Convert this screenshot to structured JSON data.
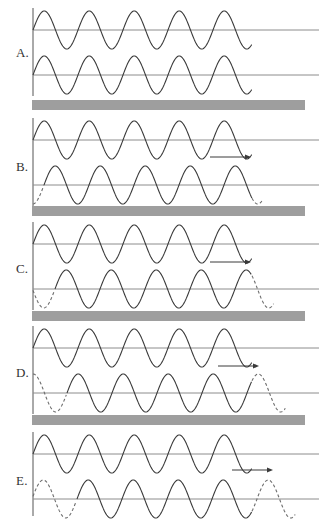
{
  "figure": {
    "type": "wave-phase-shift-diagram",
    "panel_count": 5,
    "width": 319,
    "height": 520,
    "background": "#ffffff"
  },
  "colors": {
    "wave_solid": "#3a3a3a",
    "wave_dashed": "#6d6d6d",
    "baseline": "#8c8c8c",
    "axis": "#555555",
    "separator_bar": "#9e9e9e",
    "label_text": "#333333"
  },
  "geometry": {
    "axis_x": 33,
    "wave_start_x": 33,
    "wave_end_x": 252,
    "baseline_end_x": 319,
    "wavelength": 45,
    "amplitude": 19,
    "separator_left": 32,
    "separator_right": 305,
    "separator_height": 10
  },
  "panels": [
    {
      "id": "A",
      "label": "A.",
      "label_x": 16,
      "label_y": 46,
      "top": 8,
      "axis_y0": 8,
      "axis_y1": 96,
      "arrow": null,
      "waves": [
        {
          "name": "reference-wave",
          "baseline_y": 30,
          "phase_shift_px": 0,
          "dash_lead_px": 0,
          "dash_trail_px": 0
        },
        {
          "name": "shifted-wave",
          "baseline_y": 75,
          "phase_shift_px": 0,
          "dash_lead_px": 0,
          "dash_trail_px": 0
        }
      ]
    },
    {
      "id": "B",
      "label": "B.",
      "label_x": 16,
      "label_y": 160,
      "top": 118,
      "axis_y0": 118,
      "axis_y1": 206,
      "arrow": {
        "name": "shift-direction-arrow",
        "x1": 210,
        "x2": 251,
        "y": 157,
        "direction": "right"
      },
      "waves": [
        {
          "name": "reference-wave",
          "baseline_y": 140,
          "phase_shift_px": 0,
          "dash_lead_px": 0,
          "dash_trail_px": 0
        },
        {
          "name": "shifted-wave",
          "baseline_y": 185,
          "phase_shift_px": 11,
          "dash_lead_px": 11,
          "dash_trail_px": 11
        }
      ]
    },
    {
      "id": "C",
      "label": "C.",
      "label_x": 16,
      "label_y": 262,
      "top": 222,
      "axis_y0": 222,
      "axis_y1": 310,
      "arrow": {
        "name": "shift-direction-arrow",
        "x1": 210,
        "x2": 251,
        "y": 262,
        "direction": "right"
      },
      "waves": [
        {
          "name": "reference-wave",
          "baseline_y": 244,
          "phase_shift_px": 0,
          "dash_lead_px": 0,
          "dash_trail_px": 0
        },
        {
          "name": "shifted-wave",
          "baseline_y": 289,
          "phase_shift_px": 22,
          "dash_lead_px": 22,
          "dash_trail_px": 22
        }
      ]
    },
    {
      "id": "D",
      "label": "D.",
      "label_x": 16,
      "label_y": 366,
      "top": 326,
      "axis_y0": 326,
      "axis_y1": 414,
      "arrow": {
        "name": "shift-direction-arrow",
        "x1": 218,
        "x2": 259,
        "y": 366,
        "direction": "right"
      },
      "waves": [
        {
          "name": "reference-wave",
          "baseline_y": 348,
          "phase_shift_px": 0,
          "dash_lead_px": 0,
          "dash_trail_px": 0
        },
        {
          "name": "shifted-wave",
          "baseline_y": 393,
          "phase_shift_px": 34,
          "dash_lead_px": 34,
          "dash_trail_px": 34
        }
      ]
    },
    {
      "id": "E",
      "label": "E.",
      "label_x": 16,
      "label_y": 474,
      "top": 432,
      "axis_y0": 432,
      "axis_y1": 516,
      "arrow": {
        "name": "shift-direction-arrow",
        "x1": 232,
        "x2": 273,
        "y": 470,
        "direction": "right"
      },
      "waves": [
        {
          "name": "reference-wave",
          "baseline_y": 454,
          "phase_shift_px": 0,
          "dash_lead_px": 0,
          "dash_trail_px": 0
        },
        {
          "name": "shifted-wave",
          "baseline_y": 499,
          "phase_shift_px": 44,
          "dash_lead_px": 44,
          "dash_trail_px": 44
        }
      ]
    }
  ],
  "separators": [
    {
      "name": "separator-bar-1",
      "x": 32,
      "y": 100,
      "width": 273,
      "height": 10
    },
    {
      "name": "separator-bar-2",
      "x": 32,
      "y": 206,
      "width": 273,
      "height": 10
    },
    {
      "name": "separator-bar-3",
      "x": 32,
      "y": 311,
      "width": 273,
      "height": 10
    },
    {
      "name": "separator-bar-4",
      "x": 32,
      "y": 415,
      "width": 273,
      "height": 10
    }
  ],
  "chart_data": {
    "type": "line",
    "title": "",
    "xlabel": "",
    "ylabel": "",
    "wavelength_px": 45,
    "amplitude_px": 19,
    "series": [
      {
        "name": "A-reference",
        "phase_shift_fraction": 0.0
      },
      {
        "name": "A-shifted",
        "phase_shift_fraction": 0.0
      },
      {
        "name": "B-reference",
        "phase_shift_fraction": 0.0
      },
      {
        "name": "B-shifted",
        "phase_shift_fraction": 0.25
      },
      {
        "name": "C-reference",
        "phase_shift_fraction": 0.0
      },
      {
        "name": "C-shifted",
        "phase_shift_fraction": 0.5
      },
      {
        "name": "D-reference",
        "phase_shift_fraction": 0.0
      },
      {
        "name": "D-shifted",
        "phase_shift_fraction": 0.75
      },
      {
        "name": "E-reference",
        "phase_shift_fraction": 0.0
      },
      {
        "name": "E-shifted",
        "phase_shift_fraction": 1.0
      }
    ],
    "legend": []
  }
}
